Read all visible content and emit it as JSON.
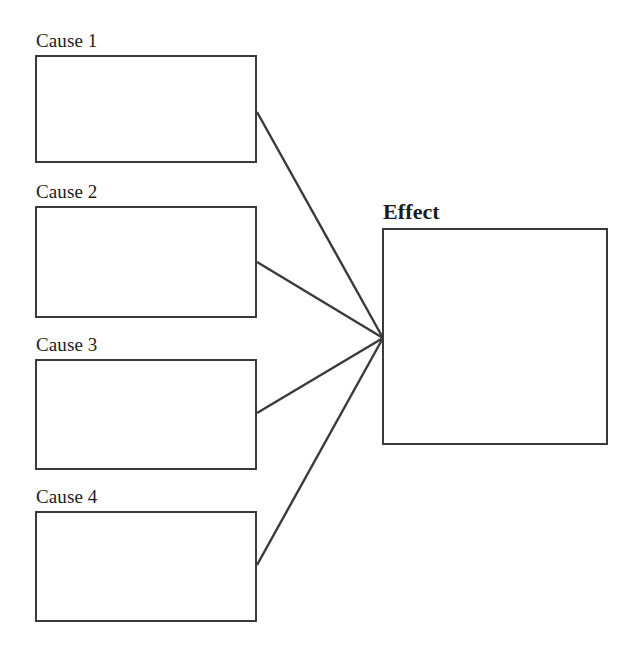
{
  "diagram": {
    "type": "cause-and-effect",
    "title_text": "",
    "background_color": "#ffffff",
    "stroke_color": "#3a3a3a",
    "text_color": "#1c1c1c",
    "causes": [
      {
        "label": "Cause 1",
        "box": {
          "x": 35,
          "y": 55,
          "width": 222,
          "height": 108
        },
        "label_pos": {
          "x": 36,
          "y": 31
        },
        "connector_from": {
          "x": 257,
          "y": 112
        }
      },
      {
        "label": "Cause 2",
        "box": {
          "x": 35,
          "y": 206,
          "width": 222,
          "height": 112
        },
        "label_pos": {
          "x": 36,
          "y": 182
        },
        "connector_from": {
          "x": 257,
          "y": 262
        }
      },
      {
        "label": "Cause 3",
        "box": {
          "x": 35,
          "y": 359,
          "width": 222,
          "height": 111
        },
        "label_pos": {
          "x": 36,
          "y": 335
        },
        "connector_from": {
          "x": 257,
          "y": 413
        }
      },
      {
        "label": "Cause 4",
        "box": {
          "x": 35,
          "y": 511,
          "width": 222,
          "height": 111
        },
        "label_pos": {
          "x": 36,
          "y": 487
        },
        "connector_from": {
          "x": 257,
          "y": 565
        }
      }
    ],
    "effect": {
      "label": "Effect",
      "box": {
        "x": 382,
        "y": 228,
        "width": 226,
        "height": 217
      },
      "label_pos": {
        "x": 383,
        "y": 201
      },
      "connector_to": {
        "x": 383,
        "y": 338
      }
    },
    "connectors": [
      {
        "from_label": "Cause 1",
        "to_label": "Effect",
        "x1": 257,
        "y1": 112,
        "x2": 383,
        "y2": 338
      },
      {
        "from_label": "Cause 2",
        "to_label": "Effect",
        "x1": 257,
        "y1": 262,
        "x2": 383,
        "y2": 338
      },
      {
        "from_label": "Cause 3",
        "to_label": "Effect",
        "x1": 257,
        "y1": 413,
        "x2": 383,
        "y2": 338
      },
      {
        "from_label": "Cause 4",
        "to_label": "Effect",
        "x1": 257,
        "y1": 565,
        "x2": 383,
        "y2": 338
      }
    ]
  }
}
